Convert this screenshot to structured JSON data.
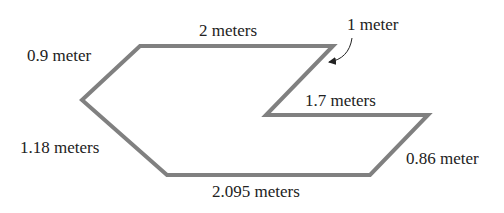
{
  "diagram": {
    "type": "polygon-with-side-lengths",
    "unit": "meters",
    "stroke_color": "#808080",
    "text_color": "#222222",
    "vertices": [
      {
        "id": "A",
        "x": 140,
        "y": 46
      },
      {
        "id": "B",
        "x": 333,
        "y": 46
      },
      {
        "id": "C",
        "x": 266,
        "y": 115
      },
      {
        "id": "D",
        "x": 428,
        "y": 115
      },
      {
        "id": "E",
        "x": 370,
        "y": 175
      },
      {
        "id": "F",
        "x": 167,
        "y": 175
      },
      {
        "id": "G",
        "x": 82,
        "y": 100
      }
    ],
    "sides": [
      {
        "from": "A",
        "to": "B",
        "label": "2 meters",
        "length": 2
      },
      {
        "from": "B",
        "to": "C",
        "label": "1 meter",
        "length": 1
      },
      {
        "from": "C",
        "to": "D",
        "label": "1.7 meters",
        "length": 1.7
      },
      {
        "from": "D",
        "to": "E",
        "label": "0.86 meter",
        "length": 0.86
      },
      {
        "from": "E",
        "to": "F",
        "label": "2.095 meters",
        "length": 2.095
      },
      {
        "from": "F",
        "to": "G",
        "label": "1.18 meters",
        "length": 1.18
      },
      {
        "from": "G",
        "to": "A",
        "label": "0.9 meter",
        "length": 0.9
      }
    ]
  },
  "labels": {
    "top": "2 meters",
    "arrow": "1 meter",
    "inner": "1.7 meters",
    "right": "0.86 meter",
    "bottom": "2.095 meters",
    "lower_left": "1.18 meters",
    "upper_left": "0.9 meter"
  }
}
